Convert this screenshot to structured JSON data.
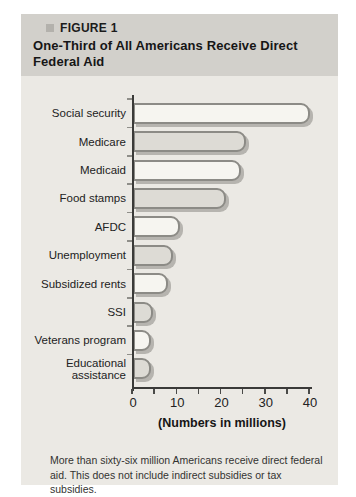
{
  "figure": {
    "label": "FIGURE 1",
    "title": "One-Third of All Americans Receive Direct Federal Aid"
  },
  "chart_data": {
    "type": "bar",
    "orientation": "horizontal",
    "categories": [
      "Social security",
      "Medicare",
      "Medicaid",
      "Food stamps",
      "AFDC",
      "Unemployment",
      "Subsidized rents",
      "SSI",
      "Veterans program",
      "Educational assistance"
    ],
    "values": [
      40,
      25.5,
      24.5,
      21,
      10.5,
      9,
      8,
      4.5,
      4,
      4
    ],
    "title": "One-Third of All Americans Receive Direct Federal Aid",
    "xlabel": "(Numbers in millions)",
    "ylabel": "",
    "xlim": [
      0,
      40
    ],
    "xticks": [
      0,
      10,
      20,
      30,
      40
    ],
    "minor_tick_step": 5,
    "grid": false,
    "legend": "none",
    "colors": {
      "bar_fill_light": "#f6f5f0",
      "bar_fill_gray": "#dddbd5",
      "bar_outline": "#8c8b86",
      "bar_shadow": "#b6b4af",
      "axis": "#3a3a38",
      "header_band_bg": "#d2d0cb",
      "panel_bg": "#ebe9e4"
    }
  },
  "caption": "More than sixty-six million Americans receive direct federal aid. This does not include indirect subsidies or tax subsidies."
}
